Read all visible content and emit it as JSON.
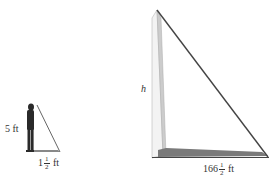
{
  "diagram": {
    "type": "similar-triangles-shadow",
    "person": {
      "height_label": "5 ft",
      "shadow_whole": "1",
      "shadow_num": "1",
      "shadow_den": "2",
      "shadow_unit": "ft"
    },
    "monument": {
      "height_label": "h",
      "shadow_whole": "166",
      "shadow_num": "1",
      "shadow_den": "2",
      "shadow_unit": "ft"
    },
    "colors": {
      "line": "#555555",
      "shadow": "#6a6a6a",
      "monument_light": "#f2f2f2",
      "monument_shade": "#cfcfcf",
      "person": "#2a2a2a",
      "text": "#333333"
    }
  }
}
